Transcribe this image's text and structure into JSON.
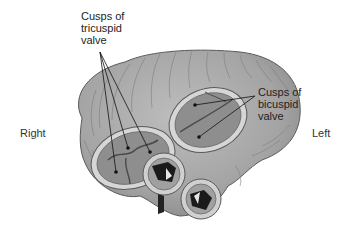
{
  "diagram": {
    "labels": {
      "tricuspid": "Cusps of\ntricuspid\nvalve",
      "bicuspid": "Cusps of\nbicuspid\nvalve",
      "right": "Right",
      "left": "Left"
    },
    "colors": {
      "background": "#ffffff",
      "muscle": "#a8a8a8",
      "muscle_dark": "#7a7a7a",
      "ring": "#d8d8d8",
      "valve_fill": "#8e8e8e",
      "opening": "#1a1a1a",
      "line": "#111111"
    },
    "pointers": {
      "tricuspid": {
        "origin": [
          100,
          52
        ],
        "targets": [
          [
            116,
            172
          ],
          [
            128,
            148
          ],
          [
            150,
            152
          ]
        ]
      },
      "bicuspid": {
        "origin": [
          255,
          96
        ],
        "targets": [
          [
            195,
            105
          ],
          [
            199,
            137
          ]
        ]
      }
    }
  }
}
